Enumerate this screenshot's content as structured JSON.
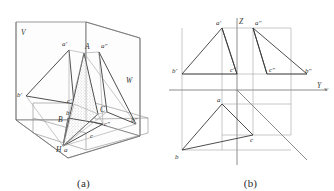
{
  "figure": {
    "captions": {
      "a": "(a)",
      "b": "(b)"
    }
  },
  "panel_a": {
    "name": "pictorial-projection-box",
    "plane_labels": {
      "v": "V",
      "w": "W",
      "h": "H"
    },
    "point_labels": {
      "A": "A",
      "B": "B",
      "C": "C",
      "a_front": "a'",
      "b_front": "b'",
      "c_front": "c'",
      "a_side": "a″",
      "b_side": "b″",
      "c_side": "c″",
      "a_top": "a",
      "b_top": "b",
      "c_top": "c"
    }
  },
  "panel_b": {
    "name": "unfolded-orthographic-projection",
    "axis_labels": {
      "z": "Z",
      "x": "X",
      "yw": "Y",
      "yw_sub": "W"
    },
    "point_labels": {
      "a_front": "a'",
      "b_front": "b'",
      "c_front": "c'",
      "a_side": "a″",
      "b_side": "b″",
      "c_side": "c″",
      "a_top": "a",
      "b_top": "b",
      "c_top": "c"
    }
  },
  "colors": {
    "line_dark": "#3a3a3a",
    "line_mid": "#707070",
    "line_light": "#9a9a9a",
    "background": "#ffffff",
    "stipple": "#8c8c8c"
  }
}
